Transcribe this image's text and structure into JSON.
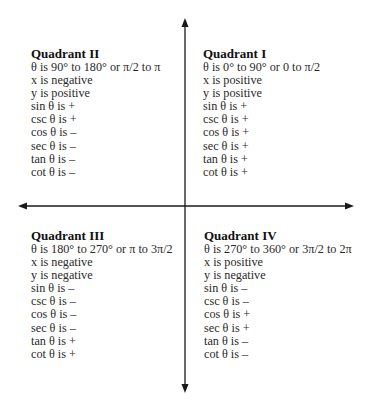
{
  "diagram": {
    "type": "trig-quadrant-sign-chart",
    "axes": {
      "horizontal": {
        "y": 206,
        "x_start": 19,
        "x_end": 353,
        "arrows": "both"
      },
      "vertical": {
        "x": 185,
        "y_start": 19,
        "y_end": 392,
        "arrows": "both"
      },
      "color": "#1a1a1a"
    },
    "quadrants": {
      "q2": {
        "title": "Quadrant II",
        "lines": [
          "θ is 90° to 180° or π/2 to π",
          "x is negative",
          "y is positive",
          "sin θ is +",
          "csc θ is +",
          "cos θ is –",
          "sec θ is –",
          "tan θ is –",
          "cot θ is –"
        ]
      },
      "q1": {
        "title": "Quadrant I",
        "lines": [
          "θ is 0° to 90° or 0 to π/2",
          "x is positive",
          "y is positive",
          "sin θ is +",
          "csc θ is +",
          "cos θ is +",
          "sec θ is +",
          "tan θ is +",
          "cot θ is +"
        ]
      },
      "q3": {
        "title": "Quadrant III",
        "lines": [
          "θ is 180° to 270° or π to 3π/2",
          "x is negative",
          "y is negative",
          "sin θ is –",
          "csc θ is –",
          "cos θ is –",
          "sec θ is –",
          "tan θ is +",
          "cot θ is +"
        ]
      },
      "q4": {
        "title": "Quadrant IV",
        "lines": [
          "θ is 270° to 360° or 3π/2 to 2π",
          "x is positive",
          "y is negative",
          "sin θ is –",
          "csc θ is –",
          "cos θ is +",
          "sec θ is +",
          "tan θ is –",
          "cot θ is –"
        ]
      }
    }
  }
}
